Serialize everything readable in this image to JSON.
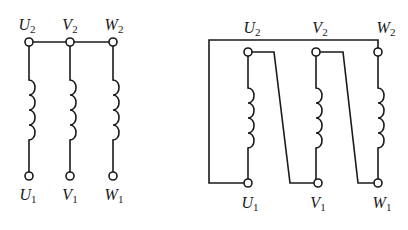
{
  "diagrams": [
    {
      "name": "star-connection",
      "top_terminals": [
        {
          "letter": "U",
          "sub": "2"
        },
        {
          "letter": "V",
          "sub": "2"
        },
        {
          "letter": "W",
          "sub": "2"
        }
      ],
      "bottom_terminals": [
        {
          "letter": "U",
          "sub": "1"
        },
        {
          "letter": "V",
          "sub": "1"
        },
        {
          "letter": "W",
          "sub": "1"
        }
      ]
    },
    {
      "name": "delta-connection",
      "top_terminals": [
        {
          "letter": "U",
          "sub": "2"
        },
        {
          "letter": "V",
          "sub": "2"
        },
        {
          "letter": "W",
          "sub": "2"
        }
      ],
      "bottom_terminals": [
        {
          "letter": "U",
          "sub": "1"
        },
        {
          "letter": "V",
          "sub": "1"
        },
        {
          "letter": "W",
          "sub": "1"
        }
      ]
    }
  ],
  "colors": {
    "line": "#1a1a1a",
    "background": "#ffffff"
  }
}
